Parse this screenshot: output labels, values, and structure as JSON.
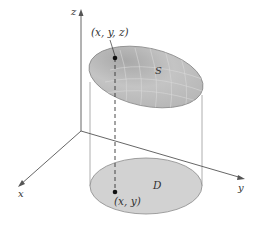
{
  "diagram": {
    "axes": {
      "x_label": "x",
      "y_label": "y",
      "z_label": "z"
    },
    "surface": {
      "label": "S",
      "point_label": "(x, y, z)"
    },
    "region": {
      "label": "D",
      "point_label": "(x, y)"
    },
    "colors": {
      "surface_fill": "#b8b8b8",
      "surface_edge": "#888888",
      "region_fill": "#d2d2d2",
      "region_edge": "#8a8a8a",
      "axis": "#555555",
      "grid": "#d8d8d8",
      "point": "#111111"
    }
  }
}
